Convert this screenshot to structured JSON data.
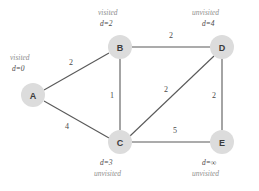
{
  "diagram": {
    "node_fill": "#dcdcdc",
    "edge_color": "#595959"
  },
  "nodes": [
    {
      "id": "A",
      "label": "A",
      "cx": 33,
      "cy": 95,
      "r": 12,
      "state": "visited",
      "distance": "d=0",
      "state_x": 10,
      "state_y": 54,
      "dist_x": 12,
      "dist_y": 65
    },
    {
      "id": "B",
      "label": "B",
      "cx": 120,
      "cy": 47,
      "r": 12,
      "state": "visited",
      "distance": "d=2",
      "state_x": 98,
      "state_y": 9,
      "dist_x": 100,
      "dist_y": 20
    },
    {
      "id": "C",
      "label": "C",
      "cx": 120,
      "cy": 142,
      "r": 12,
      "state": "unvisited",
      "distance": "d=3",
      "state_x": 94,
      "state_y": 170,
      "dist_x": 100,
      "dist_y": 159
    },
    {
      "id": "D",
      "label": "D",
      "cx": 222,
      "cy": 47,
      "r": 12,
      "state": "unvisited",
      "distance": "d=4",
      "state_x": 192,
      "state_y": 9,
      "dist_x": 202,
      "dist_y": 20
    },
    {
      "id": "E",
      "label": "E",
      "cx": 222,
      "cy": 142,
      "r": 12,
      "state": "unvisited",
      "distance": "d=∞",
      "state_x": 192,
      "state_y": 170,
      "dist_x": 202,
      "dist_y": 159
    }
  ],
  "edges": [
    {
      "id": "A-B",
      "from": "A",
      "to": "B",
      "weight": "2",
      "x1": 44,
      "y1": 90,
      "x2": 109,
      "y2": 53,
      "lx": 71,
      "ly": 62
    },
    {
      "id": "A-C",
      "from": "A",
      "to": "C",
      "weight": "4",
      "x1": 44,
      "y1": 101,
      "x2": 109,
      "y2": 138,
      "lx": 67,
      "ly": 126
    },
    {
      "id": "B-C",
      "from": "B",
      "to": "C",
      "weight": "1",
      "x1": 120,
      "y1": 59,
      "x2": 120,
      "y2": 130,
      "lx": 112,
      "ly": 95
    },
    {
      "id": "B-D",
      "from": "B",
      "to": "D",
      "weight": "2",
      "x1": 132,
      "y1": 47,
      "x2": 210,
      "y2": 47,
      "lx": 171,
      "ly": 35
    },
    {
      "id": "C-D",
      "from": "C",
      "to": "D",
      "weight": "2",
      "x1": 130,
      "y1": 136,
      "x2": 214,
      "y2": 56,
      "lx": 166,
      "ly": 89
    },
    {
      "id": "C-E",
      "from": "C",
      "to": "E",
      "weight": "5",
      "x1": 132,
      "y1": 142,
      "x2": 210,
      "y2": 142,
      "lx": 175,
      "ly": 130
    },
    {
      "id": "D-E",
      "from": "D",
      "to": "E",
      "weight": "2",
      "x1": 222,
      "y1": 59,
      "x2": 222,
      "y2": 130,
      "lx": 214,
      "ly": 95
    }
  ]
}
